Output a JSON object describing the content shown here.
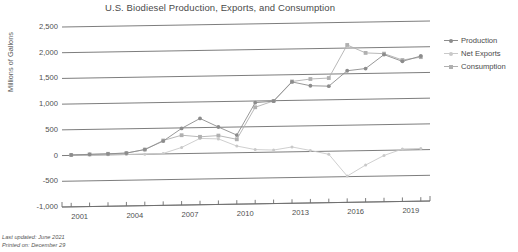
{
  "title": "U.S. Biodiesel Production, Exports, and Consumption",
  "axis": {
    "ylabel": "Millions of Gallons",
    "yticks": [
      "2,500",
      "2,000",
      "1,500",
      "1,000",
      "500",
      "0",
      "-500",
      "-1,000"
    ],
    "xticks": [
      "2001",
      "2004",
      "2007",
      "2010",
      "2013",
      "2016",
      "2019"
    ]
  },
  "legend": {
    "items": [
      {
        "label": "Production",
        "color": "#8c8c8c"
      },
      {
        "label": "Net Exports",
        "color": "#c9c9c9"
      },
      {
        "label": "Consumption",
        "color": "#b0b0b0"
      }
    ]
  },
  "footer": {
    "updated": "Last updated: June 2021",
    "printed": "Printed on: December 29"
  },
  "chart_data": {
    "type": "line",
    "title": "U.S. Biodiesel Production, Exports, and Consumption",
    "xlabel": "",
    "ylabel": "Millions of Gallons",
    "ylim": [
      -1000,
      2500
    ],
    "xlim": [
      2000.5,
      2020.5
    ],
    "grid": true,
    "legend_position": "right",
    "x": [
      2001,
      2002,
      2003,
      2004,
      2005,
      2006,
      2007,
      2008,
      2009,
      2010,
      2011,
      2012,
      2013,
      2014,
      2015,
      2016,
      2017,
      2018,
      2019,
      2020
    ],
    "series": [
      {
        "name": "Production",
        "color": "#8c8c8c",
        "values": [
          9,
          15,
          20,
          28,
          91,
          250,
          490,
          678,
          506,
          343,
          967,
          991,
          1359,
          1279,
          1265,
          1559,
          1596,
          1861,
          1724,
          1822
        ]
      },
      {
        "name": "Net Exports",
        "color": "#c9c9c9",
        "values": [
          0,
          0,
          0,
          0,
          0,
          10,
          120,
          290,
          275,
          130,
          55,
          40,
          95,
          20,
          -60,
          -490,
          -280,
          -100,
          20,
          25
        ]
      },
      {
        "name": "Consumption",
        "color": "#b0b0b0",
        "values": [
          9,
          15,
          20,
          28,
          91,
          261,
          358,
          321,
          339,
          261,
          878,
          996,
          1368,
          1410,
          1423,
          2060,
          1900,
          1880,
          1750,
          1800
        ]
      }
    ]
  }
}
